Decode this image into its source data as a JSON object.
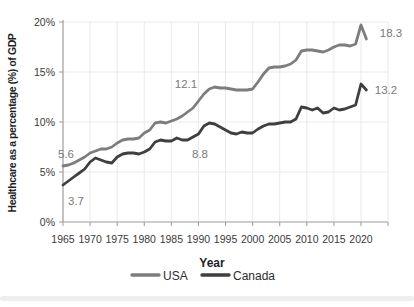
{
  "chart_data": {
    "type": "line",
    "title": "",
    "xlabel": "Year",
    "ylabel": "Healthcare as a percentage (%) of GDP",
    "x_tick_labels": [
      "1965",
      "1970",
      "1975",
      "1980",
      "1985",
      "1990",
      "1995",
      "2000",
      "2005",
      "2010",
      "2015",
      "2020"
    ],
    "y_tick_labels": [
      "0%",
      "5%",
      "10%",
      "15%",
      "20%"
    ],
    "y_tick_values": [
      0,
      5,
      10,
      15,
      20
    ],
    "ylim": [
      0,
      20
    ],
    "grid": true,
    "legend_position": "bottom",
    "years": [
      1965,
      1966,
      1967,
      1968,
      1969,
      1970,
      1971,
      1972,
      1973,
      1974,
      1975,
      1976,
      1977,
      1978,
      1979,
      1980,
      1981,
      1982,
      1983,
      1984,
      1985,
      1986,
      1987,
      1988,
      1989,
      1990,
      1991,
      1992,
      1993,
      1994,
      1995,
      1996,
      1997,
      1998,
      1999,
      2000,
      2001,
      2002,
      2003,
      2004,
      2005,
      2006,
      2007,
      2008,
      2009,
      2010,
      2011,
      2012,
      2013,
      2014,
      2015,
      2016,
      2017,
      2018,
      2019,
      2020,
      2021
    ],
    "series": [
      {
        "name": "USA",
        "color": "#7d7d7d",
        "values": [
          5.6,
          5.7,
          5.9,
          6.2,
          6.5,
          6.9,
          7.1,
          7.3,
          7.3,
          7.5,
          7.9,
          8.2,
          8.3,
          8.3,
          8.4,
          8.9,
          9.2,
          9.9,
          10.0,
          9.9,
          10.1,
          10.3,
          10.6,
          11.0,
          11.4,
          12.1,
          12.8,
          13.3,
          13.5,
          13.4,
          13.4,
          13.3,
          13.2,
          13.2,
          13.2,
          13.3,
          14.0,
          14.8,
          15.4,
          15.5,
          15.5,
          15.6,
          15.8,
          16.2,
          17.1,
          17.2,
          17.2,
          17.1,
          17.0,
          17.2,
          17.5,
          17.7,
          17.7,
          17.6,
          17.8,
          19.7,
          18.3
        ]
      },
      {
        "name": "Canada",
        "color": "#3f3f3f",
        "values": [
          3.7,
          4.1,
          4.5,
          4.9,
          5.3,
          6.0,
          6.4,
          6.2,
          6.0,
          5.9,
          6.5,
          6.8,
          6.9,
          6.9,
          6.8,
          7.0,
          7.3,
          8.0,
          8.2,
          8.1,
          8.1,
          8.4,
          8.2,
          8.2,
          8.5,
          8.8,
          9.6,
          9.9,
          9.8,
          9.5,
          9.2,
          8.9,
          8.8,
          9.0,
          8.9,
          8.9,
          9.3,
          9.6,
          9.8,
          9.8,
          9.9,
          10.0,
          10.0,
          10.3,
          11.5,
          11.4,
          11.2,
          11.4,
          10.9,
          11.0,
          11.4,
          11.2,
          11.3,
          11.5,
          11.7,
          13.8,
          13.2
        ]
      }
    ],
    "annotations": [
      {
        "text": "5.6",
        "series": "USA",
        "year": 1965
      },
      {
        "text": "3.7",
        "series": "Canada",
        "year": 1965
      },
      {
        "text": "12.1",
        "series": "USA",
        "year": 1990
      },
      {
        "text": "8.8",
        "series": "Canada",
        "year": 1990
      },
      {
        "text": "18.3",
        "series": "USA",
        "year": 2021
      },
      {
        "text": "13.2",
        "series": "Canada",
        "year": 2021
      }
    ],
    "colors": {
      "gridline": "#eaeaea",
      "axis": "#9c9c9c",
      "tick_label": "#3a3a3a",
      "data_label": "#7a7a7a",
      "axis_title": "#1f1f1f"
    }
  }
}
